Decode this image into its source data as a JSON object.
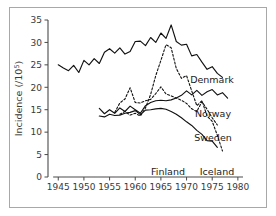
{
  "chart_data": {
    "type": "line",
    "title": "",
    "xlabel": "",
    "ylabel": "Incidence (/10",
    "ylabel_superscript": "5",
    "ylabel_suffix": ")",
    "xlim": [
      1943,
      1981
    ],
    "ylim": [
      0,
      35
    ],
    "xticks": [
      1945,
      1950,
      1955,
      1960,
      1965,
      1970,
      1975,
      1980
    ],
    "yticks": [
      0,
      5,
      10,
      15,
      20,
      25,
      30,
      35
    ],
    "xtick_labels": [
      "1945",
      "1950",
      "1955",
      "1960",
      "1965",
      "1970",
      "1975",
      "1980"
    ],
    "ytick_labels": [
      "0",
      "5",
      "10",
      "15",
      "20",
      "25",
      "30",
      "35"
    ],
    "grid": false,
    "legend_position": "inline-right-labels",
    "series": [
      {
        "name": "Denmark",
        "style": "solid",
        "label": "Denmark",
        "x": [
          1945,
          1946,
          1947,
          1948,
          1949,
          1950,
          1951,
          1952,
          1953,
          1954,
          1955,
          1956,
          1957,
          1958,
          1959,
          1960,
          1961,
          1962,
          1963,
          1964,
          1965,
          1966,
          1967,
          1968,
          1969,
          1970,
          1971,
          1972,
          1973,
          1974,
          1975,
          1976,
          1977
        ],
        "y": [
          25.0,
          24.3,
          23.7,
          24.9,
          23.3,
          26.0,
          25.0,
          26.4,
          25.3,
          27.8,
          28.6,
          27.6,
          28.8,
          27.4,
          28.0,
          30.2,
          30.3,
          29.3,
          31.1,
          30.0,
          32.1,
          30.9,
          33.9,
          30.2,
          29.4,
          29.6,
          27.0,
          27.3,
          25.6,
          24.0,
          24.6,
          23.1,
          22.2
        ]
      },
      {
        "name": "Norway",
        "style": "solid",
        "label": "Norway",
        "x": [
          1953,
          1954,
          1955,
          1956,
          1957,
          1958,
          1959,
          1960,
          1961,
          1962,
          1963,
          1964,
          1965,
          1966,
          1967,
          1968,
          1969,
          1970,
          1971,
          1972,
          1973,
          1974,
          1975,
          1976,
          1977,
          1978
        ],
        "y": [
          15.3,
          14.1,
          15.0,
          14.2,
          15.4,
          14.6,
          15.8,
          15.0,
          14.2,
          15.9,
          16.6,
          17.0,
          17.1,
          17.0,
          17.2,
          17.6,
          18.2,
          19.2,
          18.3,
          19.3,
          18.2,
          19.0,
          19.5,
          18.3,
          18.8,
          17.6
        ]
      },
      {
        "name": "Sweden",
        "style": "dashed",
        "label": "Sweden",
        "x": [
          1956,
          1957,
          1958,
          1959,
          1960,
          1961,
          1962,
          1963,
          1964,
          1965,
          1966,
          1967,
          1968,
          1969,
          1970,
          1971,
          1972,
          1973,
          1974,
          1975,
          1976
        ],
        "y": [
          14.4,
          16.5,
          17.4,
          19.9,
          16.6,
          16.5,
          17.0,
          17.3,
          18.6,
          20.1,
          18.5,
          18.1,
          17.6,
          17.1,
          16.4,
          15.2,
          14.6,
          16.8,
          15.1,
          13.2,
          11.6
        ]
      },
      {
        "name": "Finland",
        "style": "solid",
        "label": "Finland",
        "x": [
          1953,
          1954,
          1955,
          1956,
          1957,
          1958,
          1959,
          1960,
          1961,
          1962,
          1963,
          1964,
          1965,
          1966,
          1967,
          1968,
          1969,
          1970,
          1971,
          1972,
          1973,
          1974,
          1975,
          1976
        ],
        "y": [
          13.6,
          13.4,
          14.0,
          13.7,
          13.8,
          14.2,
          14.4,
          14.8,
          13.9,
          14.9,
          15.0,
          15.2,
          15.3,
          15.1,
          14.6,
          14.0,
          13.2,
          12.3,
          11.5,
          10.4,
          9.5,
          8.1,
          8.0,
          6.6
        ]
      },
      {
        "name": "Iceland",
        "style": "dashed",
        "label": "Iceland",
        "x": [
          1957,
          1958,
          1959,
          1960,
          1961,
          1962,
          1963,
          1964,
          1965,
          1966,
          1967,
          1968,
          1969,
          1970,
          1971,
          1972,
          1973,
          1974,
          1975,
          1976,
          1977
        ],
        "y": [
          14.0,
          14.6,
          13.8,
          14.2,
          13.6,
          15.4,
          18.4,
          22.6,
          26.0,
          29.5,
          28.8,
          24.2,
          22.0,
          22.6,
          19.2,
          15.9,
          17.0,
          13.6,
          12.4,
          9.3,
          5.8
        ]
      }
    ],
    "series_labels": [
      {
        "name": "Denmark",
        "x": 212,
        "y": 83
      },
      {
        "name": "Norway",
        "x": 213,
        "y": 117
      },
      {
        "name": "Sweden",
        "x": 213,
        "y": 141
      },
      {
        "name": "Finland",
        "x": 168,
        "y": 175
      },
      {
        "name": "Iceland",
        "x": 217,
        "y": 175
      }
    ]
  },
  "colors": {
    "line": "#111111",
    "axis": "#4a4a4a",
    "frame_border": "#a8a8a8",
    "background": "#ffffff",
    "text": "#3a3a3a"
  }
}
